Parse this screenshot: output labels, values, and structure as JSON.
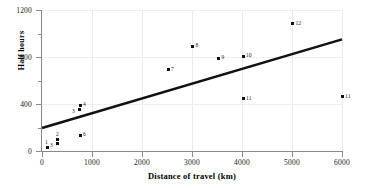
{
  "chart_data": {
    "type": "scatter",
    "title": "",
    "xlabel": "Distance of travel (km)",
    "ylabel": "Half hours",
    "xlim": [
      0,
      6000
    ],
    "ylim": [
      0,
      1200
    ],
    "xticks": [
      0,
      1000,
      2000,
      3000,
      4000,
      5000,
      6000
    ],
    "xtick_labels": [
      "0",
      "1000",
      "2000",
      "3000",
      "4000",
      "5000",
      "6000"
    ],
    "yticks": [
      0,
      400,
      800,
      1200
    ],
    "ytick_labels": [
      "0",
      "400",
      "800",
      "1200"
    ],
    "yticks_minor": [
      200,
      600,
      1000
    ],
    "grid": true,
    "legend": false,
    "point_labels": true,
    "points": [
      {
        "label": "1",
        "x": 100,
        "y": 30
      },
      {
        "label": "2",
        "x": 300,
        "y": 95
      },
      {
        "label": "3",
        "x": 300,
        "y": 60
      },
      {
        "label": "3",
        "x": 740,
        "y": 350
      },
      {
        "label": "4",
        "x": 760,
        "y": 390
      },
      {
        "label": "6",
        "x": 760,
        "y": 135
      },
      {
        "label": "7",
        "x": 2520,
        "y": 690
      },
      {
        "label": "8",
        "x": 3010,
        "y": 890
      },
      {
        "label": "9",
        "x": 3530,
        "y": 790
      },
      {
        "label": "10",
        "x": 4020,
        "y": 805
      },
      {
        "label": "11",
        "x": 4020,
        "y": 445
      },
      {
        "label": "12",
        "x": 5010,
        "y": 1085
      },
      {
        "label": "11",
        "x": 6000,
        "y": 460
      }
    ],
    "trendline": {
      "x0": 0,
      "y0": 195,
      "x1": 6000,
      "y1": 950,
      "color": "#111111",
      "width": 2.6
    }
  }
}
